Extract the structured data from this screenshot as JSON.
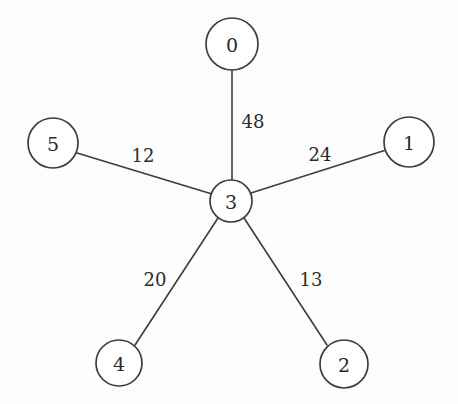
{
  "figure": {
    "background_color": "#fdfdfd",
    "stroke_color": "#3c3c3c",
    "text_color": "#2b2b2b",
    "node_fill": "#ffffff",
    "width": 458,
    "height": 404
  },
  "chart_data": {
    "type": "diagram",
    "diagram_type": "weighted-undirected-graph",
    "title": "",
    "layout": "star",
    "center_node": "3",
    "nodes": [
      {
        "id": "0",
        "label": "0",
        "cx": 232,
        "cy": 44,
        "r": 26
      },
      {
        "id": "1",
        "label": "1",
        "cx": 409,
        "cy": 142,
        "r": 25
      },
      {
        "id": "2",
        "label": "2",
        "cx": 344,
        "cy": 364,
        "r": 24
      },
      {
        "id": "3",
        "label": "3",
        "cx": 231,
        "cy": 201,
        "r": 21
      },
      {
        "id": "4",
        "label": "4",
        "cx": 119,
        "cy": 363,
        "r": 23
      },
      {
        "id": "5",
        "label": "5",
        "cx": 53,
        "cy": 143,
        "r": 25
      }
    ],
    "edges": [
      {
        "source": "0",
        "target": "3",
        "weight": 48,
        "label": "48",
        "x1": 232,
        "y1": 70,
        "x2": 232,
        "y2": 180,
        "lx": 253,
        "ly": 121
      },
      {
        "source": "5",
        "target": "3",
        "weight": 12,
        "label": "12",
        "x1": 77,
        "y1": 153,
        "x2": 212,
        "y2": 194,
        "lx": 143,
        "ly": 155
      },
      {
        "source": "3",
        "target": "1",
        "weight": 24,
        "label": "24",
        "x1": 251,
        "y1": 193,
        "x2": 386,
        "y2": 150,
        "lx": 320,
        "ly": 154
      },
      {
        "source": "3",
        "target": "4",
        "weight": 20,
        "label": "20",
        "x1": 218,
        "y1": 218,
        "x2": 135,
        "y2": 345,
        "lx": 155,
        "ly": 279
      },
      {
        "source": "3",
        "target": "2",
        "weight": 13,
        "label": "13",
        "x1": 244,
        "y1": 218,
        "x2": 327,
        "y2": 345,
        "lx": 311,
        "ly": 279
      }
    ],
    "node_count": 6,
    "edge_count": 5,
    "total_weight": 117,
    "weights": [
      48,
      12,
      24,
      20,
      13
    ]
  }
}
